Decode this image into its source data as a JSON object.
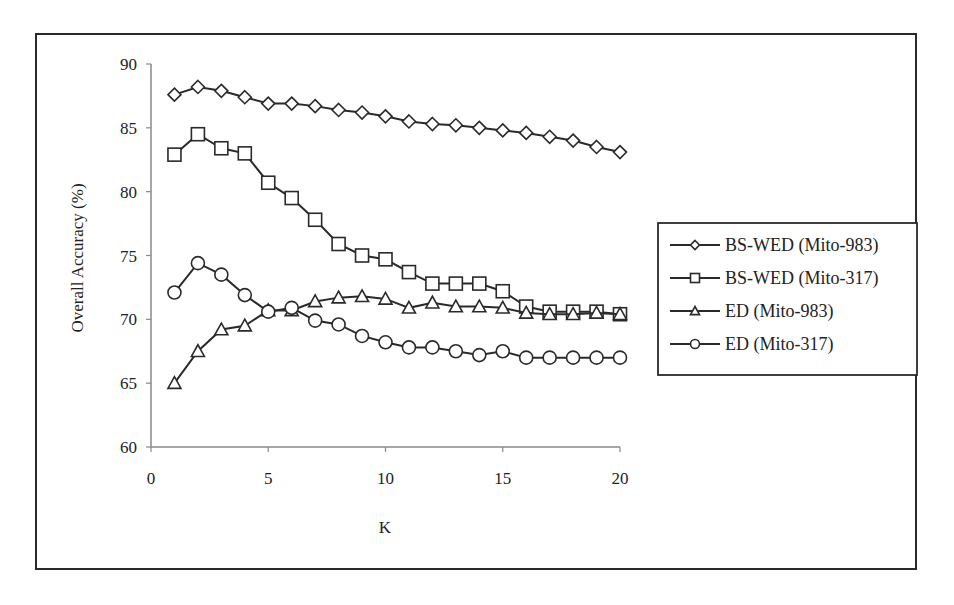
{
  "chart_data": {
    "type": "line",
    "title": "",
    "xlabel": "K",
    "ylabel": "Overall Accuracy (%)",
    "xlim": [
      0,
      20
    ],
    "ylim": [
      60,
      90
    ],
    "x_ticks": [
      0,
      5,
      10,
      15,
      20
    ],
    "y_ticks": [
      60,
      65,
      70,
      75,
      80,
      85,
      90
    ],
    "grid": false,
    "legend_position": "right",
    "x": [
      1,
      2,
      3,
      4,
      5,
      6,
      7,
      8,
      9,
      10,
      11,
      12,
      13,
      14,
      15,
      16,
      17,
      18,
      19,
      20
    ],
    "series": [
      {
        "name": "BS-WED (Mito-983)",
        "marker": "diamond",
        "values": [
          87.6,
          88.2,
          87.9,
          87.4,
          86.9,
          86.9,
          86.7,
          86.4,
          86.2,
          85.9,
          85.5,
          85.3,
          85.2,
          85.0,
          84.8,
          84.6,
          84.3,
          84.0,
          83.5,
          83.1
        ]
      },
      {
        "name": "BS-WED (Mito-317)",
        "marker": "square",
        "values": [
          82.9,
          84.5,
          83.4,
          83.0,
          80.7,
          79.5,
          77.8,
          75.9,
          75.0,
          74.7,
          73.7,
          72.8,
          72.8,
          72.8,
          72.2,
          71.0,
          70.6,
          70.6,
          70.6,
          70.4
        ]
      },
      {
        "name": "ED (Mito-983)",
        "marker": "triangle",
        "values": [
          65.0,
          67.5,
          69.2,
          69.5,
          70.7,
          70.7,
          71.4,
          71.7,
          71.8,
          71.6,
          70.9,
          71.3,
          71.0,
          71.0,
          70.9,
          70.5,
          70.4,
          70.4,
          70.5,
          70.4
        ]
      },
      {
        "name": "ED (Mito-317)",
        "marker": "circle",
        "values": [
          72.1,
          74.4,
          73.5,
          71.9,
          70.6,
          70.9,
          69.9,
          69.6,
          68.7,
          68.2,
          67.8,
          67.8,
          67.5,
          67.2,
          67.5,
          67.0,
          67.0,
          67.0,
          67.0,
          67.0
        ]
      }
    ]
  },
  "colors": {
    "line": "#2a2a2a",
    "axis": "#888888",
    "background": "#ffffff"
  }
}
